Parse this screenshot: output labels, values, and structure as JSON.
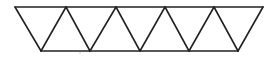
{
  "diagram": {
    "stroke_color": "#222222",
    "background": "#ffffff",
    "top_edge": {
      "x1": 15,
      "x2": 263,
      "y": 7
    },
    "bottom_edge": {
      "x1": 41,
      "x2": 238,
      "y": 51
    },
    "top_vertices_x": [
      15,
      66,
      116,
      165,
      214,
      263
    ],
    "bottom_vertices_x": [
      41,
      90,
      140,
      189,
      238
    ],
    "triangle_count": 10
  }
}
